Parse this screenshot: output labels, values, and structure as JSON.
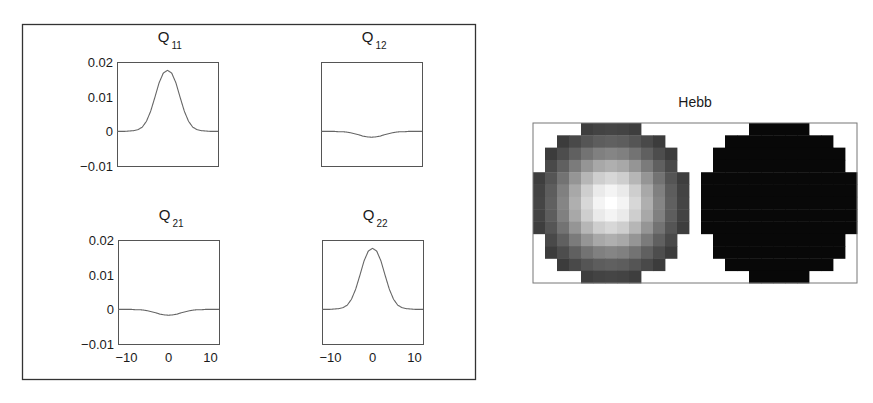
{
  "chart_data": [
    {
      "type": "line",
      "panel": "left",
      "layout": "2x2 grid of subplots",
      "subplots": [
        {
          "id": "Q11",
          "title": "Q",
          "title_sub": "11",
          "x": [
            -12,
            -11,
            -10,
            -9,
            -8,
            -7,
            -6,
            -5,
            -4,
            -3,
            -2,
            -1,
            0,
            1,
            2,
            3,
            4,
            5,
            6,
            7,
            8,
            9,
            10,
            11,
            12
          ],
          "values": [
            0,
            0,
            0,
            0.0001,
            0.0002,
            0.0005,
            0.0012,
            0.0029,
            0.0058,
            0.0098,
            0.014,
            0.0168,
            0.0176,
            0.0168,
            0.014,
            0.0098,
            0.0058,
            0.0029,
            0.0012,
            0.0005,
            0.0002,
            0.0001,
            0,
            0,
            0
          ],
          "xlim": [
            -12,
            12
          ],
          "ylim": [
            -0.01,
            0.02
          ],
          "yticks": [
            "0.02",
            "0.01",
            "0",
            "−0.01"
          ],
          "show_yticks": true,
          "show_xticks": false
        },
        {
          "id": "Q12",
          "title": "Q",
          "title_sub": "12",
          "x": [
            -12,
            -11,
            -10,
            -9,
            -8,
            -7,
            -6,
            -5,
            -4,
            -3,
            -2,
            -1,
            0,
            1,
            2,
            3,
            4,
            5,
            6,
            7,
            8,
            9,
            10,
            11,
            12
          ],
          "values": [
            0,
            0,
            0,
            0,
            -0.0001,
            -0.0001,
            -0.0002,
            -0.0004,
            -0.0007,
            -0.001,
            -0.0014,
            -0.0016,
            -0.0017,
            -0.0016,
            -0.0014,
            -0.001,
            -0.0007,
            -0.0004,
            -0.0002,
            -0.0001,
            -0.0001,
            0,
            0,
            0,
            0
          ],
          "xlim": [
            -12,
            12
          ],
          "ylim": [
            -0.01,
            0.02
          ],
          "show_yticks": false,
          "show_xticks": false
        },
        {
          "id": "Q21",
          "title": "Q",
          "title_sub": "21",
          "x": [
            -12,
            -11,
            -10,
            -9,
            -8,
            -7,
            -6,
            -5,
            -4,
            -3,
            -2,
            -1,
            0,
            1,
            2,
            3,
            4,
            5,
            6,
            7,
            8,
            9,
            10,
            11,
            12
          ],
          "values": [
            0,
            0,
            0,
            0,
            -0.0001,
            -0.0001,
            -0.0002,
            -0.0004,
            -0.0007,
            -0.001,
            -0.0014,
            -0.0016,
            -0.0017,
            -0.0016,
            -0.0014,
            -0.001,
            -0.0007,
            -0.0004,
            -0.0002,
            -0.0001,
            -0.0001,
            0,
            0,
            0,
            0
          ],
          "xlim": [
            -12,
            12
          ],
          "ylim": [
            -0.01,
            0.02
          ],
          "yticks": [
            "0.02",
            "0.01",
            "0",
            "−0.01"
          ],
          "show_yticks": true,
          "xticks": [
            "−10",
            "0",
            "10"
          ],
          "show_xticks": true
        },
        {
          "id": "Q22",
          "title": "Q",
          "title_sub": "22",
          "x": [
            -12,
            -11,
            -10,
            -9,
            -8,
            -7,
            -6,
            -5,
            -4,
            -3,
            -2,
            -1,
            0,
            1,
            2,
            3,
            4,
            5,
            6,
            7,
            8,
            9,
            10,
            11,
            12
          ],
          "values": [
            0,
            0,
            0,
            0.0001,
            0.0002,
            0.0005,
            0.0012,
            0.0029,
            0.0058,
            0.0098,
            0.014,
            0.0168,
            0.0176,
            0.0168,
            0.014,
            0.0098,
            0.0058,
            0.0029,
            0.0012,
            0.0005,
            0.0002,
            0.0001,
            0,
            0,
            0
          ],
          "xlim": [
            -12,
            12
          ],
          "ylim": [
            -0.01,
            0.02
          ],
          "show_yticks": false,
          "xticks": [
            "−10",
            "0",
            "10"
          ],
          "show_xticks": true
        }
      ],
      "yticks_values": [
        0.02,
        0.01,
        0,
        -0.01
      ],
      "xticks_values": [
        -10,
        0,
        10
      ],
      "grid": false
    },
    {
      "type": "heatmap",
      "panel": "right",
      "title": "Hebb",
      "colormap": "gray",
      "grid_rows": 13,
      "grid_cols": 27,
      "description": "Two circular 13x13 receptive fields side by side; left field bright Gaussian blob centered, right field uniformly dark",
      "disk_row_spans": [
        [
          4,
          8
        ],
        [
          2,
          10
        ],
        [
          1,
          11
        ],
        [
          1,
          11
        ],
        [
          0,
          12
        ],
        [
          0,
          12
        ],
        [
          0,
          12
        ],
        [
          0,
          12
        ],
        [
          0,
          12
        ],
        [
          1,
          11
        ],
        [
          1,
          11
        ],
        [
          2,
          10
        ],
        [
          4,
          8
        ]
      ],
      "fields": [
        {
          "name": "left",
          "col_offset": 0,
          "pattern": "gaussian",
          "center": [
            6,
            6
          ],
          "sigma": 3.2,
          "min_gray": 30,
          "max_gray": 255
        },
        {
          "name": "right",
          "col_offset": 14,
          "pattern": "uniform",
          "gray": 8
        }
      ]
    }
  ],
  "figure": {
    "left_panel": {
      "frame": true
    },
    "right_panel": {
      "title": "Hebb"
    }
  }
}
